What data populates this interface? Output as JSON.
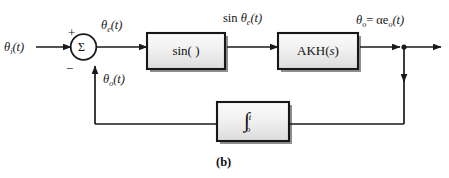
{
  "figure": {
    "caption": "(b)",
    "type": "control-system-block-diagram"
  },
  "signals": {
    "input": "θᵢ(t)",
    "input_base": "θ",
    "input_sub": "i",
    "input_tail": "(t)",
    "error_base": "θ",
    "error_sub": "e",
    "error_tail": "(t)",
    "sine_label_prefix": "sin ",
    "sine_base": "θ",
    "sine_sub": "e",
    "sine_tail": "(t)",
    "output_base": "θ",
    "output_sub": "o",
    "output_mid": "= αe",
    "output_sub2": "o",
    "output_tail": "(t)",
    "feedback_base": "θ",
    "feedback_sub": "o",
    "feedback_tail": "(t)"
  },
  "summing_junction": {
    "symbol": "Σ",
    "plus_sign": "+",
    "minus_sign": "−"
  },
  "blocks": {
    "sine": {
      "label": "sin(   )",
      "name": "sine-block"
    },
    "plant": {
      "label_prefix": "AKH(",
      "label_var": "s",
      "label_suffix": ")",
      "name": "akh-transfer-function-block"
    },
    "integrator": {
      "glyph": "∫",
      "upper_limit": "t",
      "lower_limit": "o",
      "name": "integrator-block"
    }
  },
  "colors": {
    "line": "#1a1a1d",
    "block_border": "#171719",
    "block_fill_light": "#f4f4f4",
    "block_fill_dark": "#d8d8d8",
    "shadow": "#8a8a8a",
    "background": "#ffffff",
    "text": "#17171a"
  }
}
